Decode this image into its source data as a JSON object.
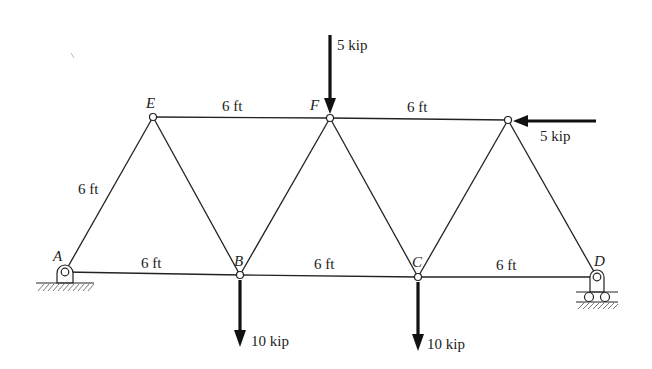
{
  "diagram": {
    "type": "planar truss",
    "joints": [
      {
        "id": "A",
        "label": "A",
        "support": "pin"
      },
      {
        "id": "B",
        "label": "B"
      },
      {
        "id": "C",
        "label": "C"
      },
      {
        "id": "D",
        "label": "D",
        "support": "roller"
      },
      {
        "id": "E",
        "label": "E"
      },
      {
        "id": "F",
        "label": "F"
      },
      {
        "id": "G",
        "label": ""
      }
    ],
    "members": [
      {
        "from": "A",
        "to": "B"
      },
      {
        "from": "B",
        "to": "C"
      },
      {
        "from": "C",
        "to": "D"
      },
      {
        "from": "E",
        "to": "F"
      },
      {
        "from": "F",
        "to": "G"
      },
      {
        "from": "A",
        "to": "E"
      },
      {
        "from": "E",
        "to": "B"
      },
      {
        "from": "B",
        "to": "F"
      },
      {
        "from": "F",
        "to": "C"
      },
      {
        "from": "C",
        "to": "G"
      },
      {
        "from": "G",
        "to": "D"
      }
    ],
    "dimensions": {
      "AB": "6 ft",
      "BC": "6 ft",
      "CD": "6 ft",
      "EF": "6 ft",
      "FG": "6 ft",
      "AE": "6 ft"
    },
    "loads": [
      {
        "joint": "F",
        "label": "5 kip",
        "direction": "down"
      },
      {
        "joint": "G",
        "label": "5 kip",
        "direction": "left"
      },
      {
        "joint": "B",
        "label": "10 kip",
        "direction": "down"
      },
      {
        "joint": "C",
        "label": "10 kip",
        "direction": "down"
      }
    ]
  }
}
